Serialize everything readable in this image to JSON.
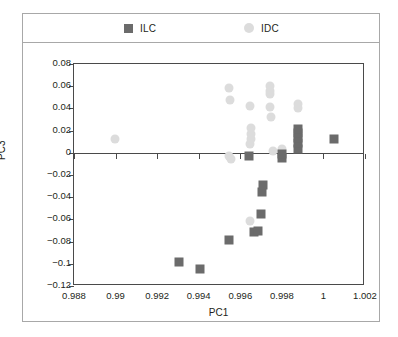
{
  "legend": {
    "entries": [
      {
        "label": "ILC",
        "marker": "square",
        "color": "#6b6b6b"
      },
      {
        "label": "IDC",
        "marker": "circle",
        "color": "#dcdcdc"
      }
    ]
  },
  "axes": {
    "xlabel": "PC1",
    "ylabel": "PC3",
    "xticks": [
      "0.988",
      "0.99",
      "0.992",
      "0.994",
      "0.996",
      "0.998",
      "1",
      "1.002"
    ],
    "yticks": [
      "0.08",
      "0.06",
      "0.04",
      "0.02",
      "0",
      "-0.02",
      "-0.04",
      "-0.06",
      "-0.08",
      "-0.1",
      "-0.12"
    ]
  },
  "chart_data": {
    "type": "scatter",
    "title": "",
    "xlabel": "PC1",
    "ylabel": "PC3",
    "xlim": [
      0.988,
      1.002
    ],
    "ylim": [
      -0.12,
      0.08
    ],
    "xticks": [
      0.988,
      0.99,
      0.992,
      0.994,
      0.996,
      0.998,
      1.0,
      1.002
    ],
    "yticks": [
      -0.12,
      -0.1,
      -0.08,
      -0.06,
      -0.04,
      -0.02,
      0,
      0.02,
      0.04,
      0.06,
      0.08
    ],
    "grid": false,
    "zero_line": 0,
    "legend_position": "top",
    "series": [
      {
        "name": "ILC",
        "marker": "square",
        "color": "#6b6b6b",
        "points": [
          [
            0.99305,
            -0.0985
          ],
          [
            0.99405,
            -0.1045
          ],
          [
            0.99545,
            -0.0785
          ],
          [
            0.99665,
            -0.0715
          ],
          [
            0.99685,
            -0.07
          ],
          [
            0.997,
            -0.0555
          ],
          [
            0.99705,
            -0.0355
          ],
          [
            0.9971,
            -0.029
          ],
          [
            0.9964,
            -0.003
          ],
          [
            0.998,
            -0.0045
          ],
          [
            0.998,
            -0.0015
          ],
          [
            0.9988,
            0.0035
          ],
          [
            0.9988,
            0.009
          ],
          [
            0.9988,
            0.0135
          ],
          [
            0.9988,
            0.0175
          ],
          [
            0.9988,
            0.0215
          ],
          [
            1.0005,
            0.012
          ]
        ]
      },
      {
        "name": "IDC",
        "marker": "circle",
        "color": "#dcdcdc",
        "points": [
          [
            0.98995,
            0.0125
          ],
          [
            0.99545,
            -0.003
          ],
          [
            0.99555,
            -0.0055
          ],
          [
            0.99545,
            0.058
          ],
          [
            0.9955,
            0.0475
          ],
          [
            0.99645,
            0.042
          ],
          [
            0.99645,
            0.008
          ],
          [
            0.9965,
            0.012
          ],
          [
            0.9965,
            0.017
          ],
          [
            0.9965,
            0.022
          ],
          [
            0.99645,
            -0.061
          ],
          [
            0.99745,
            0.0415
          ],
          [
            0.99745,
            0.053
          ],
          [
            0.99745,
            0.0555
          ],
          [
            0.99745,
            0.06
          ],
          [
            0.9975,
            0.032
          ],
          [
            0.99755,
            0.002
          ],
          [
            0.998,
            0.003
          ],
          [
            0.9988,
            0.04
          ],
          [
            0.9988,
            0.044
          ]
        ]
      }
    ]
  }
}
